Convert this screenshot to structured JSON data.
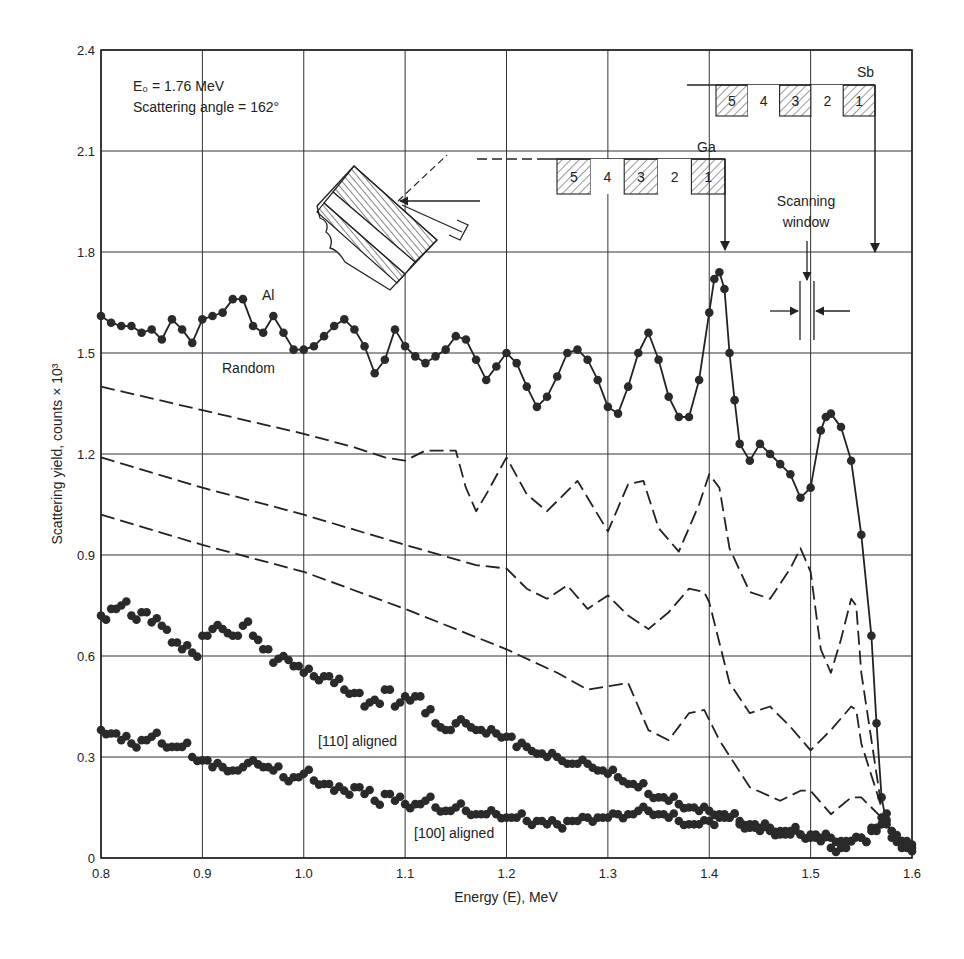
{
  "chart_data": {
    "type": "scatter",
    "title": "",
    "xlabel": "Energy (E), MeV",
    "ylabel": "Scattering yield, counts × 10³",
    "xlim": [
      0.8,
      1.6
    ],
    "ylim": [
      0,
      2.4
    ],
    "xticks": [
      "0.8",
      "0.9",
      "1.0",
      "1.1",
      "1.2",
      "1.3",
      "1.4",
      "1.5",
      "1.6"
    ],
    "yticks": [
      "0",
      "0.3",
      "0.6",
      "0.9",
      "1.2",
      "1.5",
      "1.8",
      "2.1",
      "2.4"
    ],
    "grid": true,
    "annotations": {
      "e0": "E₀ = 1.76 MeV",
      "angle": "Scattering angle = 162°",
      "al": "Al",
      "random": "Random",
      "aligned_110": "[110] aligned",
      "aligned_100": "[100] aligned",
      "ga": "Ga",
      "sb": "Sb",
      "scanning_window_1": "Scanning",
      "scanning_window_2": "window",
      "layers": [
        "5",
        "4",
        "3",
        "2",
        "1"
      ]
    },
    "series": [
      {
        "name": "Random",
        "style": "dots-with-line",
        "x": [
          0.8,
          0.81,
          0.82,
          0.83,
          0.84,
          0.85,
          0.86,
          0.87,
          0.88,
          0.89,
          0.9,
          0.91,
          0.92,
          0.93,
          0.94,
          0.95,
          0.96,
          0.97,
          0.98,
          0.99,
          1.0,
          1.01,
          1.02,
          1.03,
          1.04,
          1.05,
          1.06,
          1.07,
          1.08,
          1.09,
          1.1,
          1.11,
          1.12,
          1.13,
          1.14,
          1.15,
          1.16,
          1.17,
          1.18,
          1.19,
          1.2,
          1.21,
          1.22,
          1.23,
          1.24,
          1.25,
          1.26,
          1.27,
          1.28,
          1.29,
          1.3,
          1.31,
          1.32,
          1.33,
          1.34,
          1.35,
          1.36,
          1.37,
          1.38,
          1.39,
          1.4,
          1.405,
          1.41,
          1.415,
          1.42,
          1.425,
          1.43,
          1.44,
          1.45,
          1.46,
          1.47,
          1.48,
          1.49,
          1.5,
          1.51,
          1.515,
          1.52,
          1.53,
          1.54,
          1.55,
          1.56,
          1.565,
          1.57,
          1.575,
          1.58,
          1.59,
          1.6
        ],
        "y": [
          1.61,
          1.59,
          1.58,
          1.58,
          1.56,
          1.57,
          1.54,
          1.6,
          1.57,
          1.53,
          1.6,
          1.61,
          1.62,
          1.66,
          1.66,
          1.58,
          1.56,
          1.61,
          1.56,
          1.51,
          1.51,
          1.52,
          1.55,
          1.58,
          1.6,
          1.57,
          1.52,
          1.44,
          1.48,
          1.57,
          1.52,
          1.49,
          1.47,
          1.49,
          1.51,
          1.55,
          1.54,
          1.48,
          1.42,
          1.46,
          1.5,
          1.47,
          1.4,
          1.34,
          1.37,
          1.43,
          1.5,
          1.51,
          1.48,
          1.42,
          1.34,
          1.32,
          1.4,
          1.5,
          1.56,
          1.48,
          1.37,
          1.31,
          1.31,
          1.42,
          1.62,
          1.72,
          1.74,
          1.69,
          1.5,
          1.36,
          1.23,
          1.18,
          1.23,
          1.2,
          1.17,
          1.14,
          1.07,
          1.1,
          1.27,
          1.31,
          1.32,
          1.28,
          1.18,
          0.96,
          0.66,
          0.4,
          0.18,
          0.1,
          0.08,
          0.05,
          0.04
        ]
      },
      {
        "name": "Dashed curve A (top)",
        "style": "dashed",
        "x": [
          0.8,
          0.9,
          1.0,
          1.05,
          1.08,
          1.1,
          1.12,
          1.15,
          1.16,
          1.17,
          1.18,
          1.2,
          1.22,
          1.24,
          1.27,
          1.3,
          1.32,
          1.335,
          1.35,
          1.37,
          1.39,
          1.4,
          1.41,
          1.42,
          1.44,
          1.46,
          1.48,
          1.49,
          1.5,
          1.51,
          1.52,
          1.53,
          1.54,
          1.545,
          1.55,
          1.57
        ],
        "y": [
          1.4,
          1.33,
          1.26,
          1.22,
          1.19,
          1.18,
          1.21,
          1.21,
          1.1,
          1.03,
          1.08,
          1.19,
          1.08,
          1.03,
          1.12,
          0.97,
          1.11,
          1.12,
          0.98,
          0.91,
          1.05,
          1.14,
          1.1,
          0.92,
          0.79,
          0.77,
          0.86,
          0.92,
          0.85,
          0.62,
          0.55,
          0.65,
          0.77,
          0.75,
          0.55,
          0.15
        ]
      },
      {
        "name": "Dashed curve B (middle)",
        "style": "dashed",
        "x": [
          0.8,
          0.9,
          1.0,
          1.1,
          1.17,
          1.2,
          1.22,
          1.24,
          1.26,
          1.28,
          1.3,
          1.32,
          1.34,
          1.36,
          1.38,
          1.395,
          1.4,
          1.42,
          1.44,
          1.46,
          1.48,
          1.5,
          1.52,
          1.54,
          1.545,
          1.55,
          1.57
        ],
        "y": [
          1.19,
          1.1,
          1.02,
          0.93,
          0.87,
          0.86,
          0.8,
          0.77,
          0.81,
          0.74,
          0.78,
          0.72,
          0.68,
          0.73,
          0.8,
          0.79,
          0.76,
          0.52,
          0.43,
          0.45,
          0.39,
          0.32,
          0.38,
          0.45,
          0.44,
          0.34,
          0.15
        ]
      },
      {
        "name": "Dashed curve C (bottom)",
        "style": "dashed",
        "x": [
          0.8,
          0.9,
          1.0,
          1.1,
          1.2,
          1.25,
          1.28,
          1.3,
          1.32,
          1.34,
          1.36,
          1.38,
          1.395,
          1.41,
          1.44,
          1.47,
          1.49,
          1.5,
          1.52,
          1.54,
          1.55,
          1.57
        ],
        "y": [
          1.02,
          0.93,
          0.85,
          0.74,
          0.62,
          0.55,
          0.5,
          0.51,
          0.52,
          0.38,
          0.35,
          0.43,
          0.44,
          0.35,
          0.21,
          0.17,
          0.2,
          0.2,
          0.13,
          0.18,
          0.18,
          0.12
        ]
      },
      {
        "name": "[110] aligned",
        "style": "dots",
        "x": [
          0.8,
          0.81,
          0.82,
          0.83,
          0.84,
          0.85,
          0.86,
          0.87,
          0.88,
          0.89,
          0.9,
          0.91,
          0.92,
          0.93,
          0.94,
          0.95,
          0.96,
          0.97,
          0.98,
          0.99,
          1.0,
          1.01,
          1.02,
          1.03,
          1.04,
          1.05,
          1.06,
          1.07,
          1.08,
          1.09,
          1.1,
          1.11,
          1.12,
          1.13,
          1.14,
          1.15,
          1.16,
          1.17,
          1.18,
          1.19,
          1.2,
          1.21,
          1.22,
          1.23,
          1.24,
          1.25,
          1.26,
          1.27,
          1.28,
          1.29,
          1.3,
          1.31,
          1.32,
          1.33,
          1.34,
          1.35,
          1.36,
          1.37,
          1.38,
          1.39,
          1.4,
          1.41,
          1.42,
          1.43,
          1.44,
          1.45,
          1.46,
          1.47,
          1.48,
          1.49,
          1.5,
          1.51,
          1.52,
          1.53,
          1.54,
          1.55,
          1.56,
          1.57,
          1.58,
          1.59,
          1.6
        ],
        "y": [
          0.72,
          0.74,
          0.75,
          0.72,
          0.73,
          0.7,
          0.69,
          0.64,
          0.62,
          0.61,
          0.66,
          0.68,
          0.68,
          0.66,
          0.69,
          0.66,
          0.62,
          0.58,
          0.6,
          0.57,
          0.55,
          0.54,
          0.54,
          0.52,
          0.5,
          0.49,
          0.45,
          0.47,
          0.5,
          0.45,
          0.48,
          0.48,
          0.43,
          0.4,
          0.38,
          0.4,
          0.4,
          0.38,
          0.37,
          0.37,
          0.36,
          0.33,
          0.33,
          0.31,
          0.3,
          0.3,
          0.28,
          0.28,
          0.28,
          0.26,
          0.25,
          0.24,
          0.22,
          0.21,
          0.19,
          0.18,
          0.17,
          0.16,
          0.15,
          0.14,
          0.14,
          0.13,
          0.12,
          0.11,
          0.1,
          0.09,
          0.09,
          0.08,
          0.08,
          0.07,
          0.07,
          0.06,
          0.06,
          0.05,
          0.05,
          0.06,
          0.09,
          0.12,
          0.06,
          0.03,
          0.02
        ]
      },
      {
        "name": "[100] aligned",
        "style": "dots",
        "x": [
          0.8,
          0.81,
          0.82,
          0.83,
          0.84,
          0.85,
          0.86,
          0.87,
          0.88,
          0.89,
          0.9,
          0.91,
          0.92,
          0.93,
          0.94,
          0.95,
          0.96,
          0.97,
          0.98,
          0.99,
          1.0,
          1.01,
          1.02,
          1.03,
          1.04,
          1.05,
          1.06,
          1.07,
          1.08,
          1.09,
          1.1,
          1.11,
          1.12,
          1.13,
          1.14,
          1.15,
          1.16,
          1.17,
          1.18,
          1.19,
          1.2,
          1.21,
          1.22,
          1.23,
          1.24,
          1.25,
          1.26,
          1.27,
          1.28,
          1.29,
          1.3,
          1.31,
          1.32,
          1.33,
          1.34,
          1.35,
          1.36,
          1.37,
          1.38,
          1.39,
          1.4,
          1.41,
          1.42,
          1.43,
          1.44,
          1.45,
          1.46,
          1.47,
          1.48,
          1.49,
          1.5,
          1.51,
          1.52,
          1.53,
          1.54,
          1.55,
          1.56,
          1.57,
          1.58,
          1.59,
          1.6
        ],
        "y": [
          0.38,
          0.37,
          0.35,
          0.34,
          0.35,
          0.36,
          0.34,
          0.33,
          0.33,
          0.3,
          0.29,
          0.27,
          0.27,
          0.26,
          0.27,
          0.29,
          0.27,
          0.26,
          0.24,
          0.24,
          0.25,
          0.23,
          0.22,
          0.2,
          0.2,
          0.21,
          0.19,
          0.17,
          0.19,
          0.17,
          0.16,
          0.16,
          0.17,
          0.15,
          0.14,
          0.15,
          0.14,
          0.13,
          0.13,
          0.13,
          0.12,
          0.12,
          0.11,
          0.11,
          0.1,
          0.1,
          0.11,
          0.11,
          0.12,
          0.12,
          0.12,
          0.13,
          0.13,
          0.14,
          0.14,
          0.13,
          0.12,
          0.11,
          0.1,
          0.1,
          0.11,
          0.12,
          0.12,
          0.1,
          0.09,
          0.08,
          0.08,
          0.07,
          0.07,
          0.07,
          0.06,
          0.05,
          0.03,
          0.03,
          0.05,
          0.06,
          0.08,
          0.1,
          0.08,
          0.05,
          0.03
        ]
      }
    ],
    "legend_position": "inline-annotations"
  }
}
